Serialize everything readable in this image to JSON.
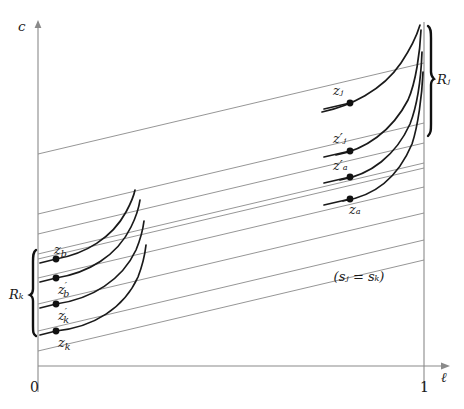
{
  "figure": {
    "name": "indifference-curves-zones-diagram",
    "axes": {
      "y_axis_label": "c",
      "x_axis_label": "ℓ",
      "origin_label": "0",
      "right_tick_label": "1",
      "y_axis_x": 38,
      "x_axis_y": 366,
      "right_vertical_x": 424,
      "y_axis_top": 22
    },
    "annotation": {
      "equality_note": "(sⱼ = sₖ)",
      "x": 360,
      "y": 276
    },
    "brackets": [
      {
        "name": "R_k",
        "label": "Rₖ",
        "x": 36,
        "y_top": 250,
        "y_bottom": 336,
        "label_x": 12,
        "label_y": 295
      },
      {
        "name": "R_j",
        "label": "Rⱼ",
        "x": 428,
        "y_top": 26,
        "y_bottom": 136,
        "label_x": 438,
        "label_y": 80
      }
    ],
    "points": [
      {
        "name": "z_j",
        "label": "zⱼ",
        "x": 350,
        "y": 103,
        "label_x": 334,
        "label_y": 92,
        "label_pos": "above-left"
      },
      {
        "name": "z_j_prime",
        "label": "z′ⱼ",
        "x": 350,
        "y": 151,
        "label_x": 334,
        "label_y": 140,
        "label_pos": "above-left"
      },
      {
        "name": "z_a_prime",
        "label": "z′ₐ",
        "x": 350,
        "y": 177,
        "label_x": 334,
        "label_y": 166,
        "label_pos": "above-left"
      },
      {
        "name": "z_a",
        "label": "zₐ",
        "x": 350,
        "y": 199,
        "label_x": 350,
        "label_y": 212,
        "label_pos": "below-right"
      },
      {
        "name": "z_b",
        "label": "z_b",
        "x": 56,
        "y": 259,
        "label_x": 56,
        "label_y": 250,
        "label_pos": "above-right"
      },
      {
        "name": "z_b_prime",
        "label": "z'_b",
        "x": 56,
        "y": 278,
        "label_x": 60,
        "label_y": 292,
        "label_pos": "below-right"
      },
      {
        "name": "z_k_prime",
        "label": "z'_k",
        "x": 56,
        "y": 304,
        "label_x": 60,
        "label_y": 318,
        "label_pos": "below-right"
      },
      {
        "name": "z_k",
        "label": "z_k",
        "x": 56,
        "y": 331,
        "label_x": 60,
        "label_y": 345,
        "label_pos": "below-right"
      }
    ],
    "budget_lines": {
      "color": "#8a8a8a",
      "count": 9,
      "slope": -0.236,
      "left_x": 38,
      "right_x": 424,
      "left_y": [
        154,
        214,
        234,
        254,
        259,
        278,
        304,
        331,
        351
      ]
    },
    "indifference_curves": {
      "color": "#1a1a1a",
      "left_group": [
        {
          "name": "curve-z_b",
          "x0": 56,
          "y0": 259,
          "x1": 135,
          "y1": 191
        },
        {
          "name": "curve-z_b'",
          "x0": 56,
          "y0": 278,
          "x1": 140,
          "y1": 201
        },
        {
          "name": "curve-z_k'",
          "x0": 56,
          "y0": 304,
          "x1": 143,
          "y1": 222
        },
        {
          "name": "curve-z_k",
          "x0": 56,
          "y0": 331,
          "x1": 145,
          "y1": 245
        }
      ],
      "right_group": [
        {
          "name": "curve-z_j",
          "x0": 350,
          "y0": 103,
          "x1": 424,
          "y1": 26
        },
        {
          "name": "curve-z_j'",
          "x0": 350,
          "y0": 151,
          "x1": 424,
          "y1": 30
        },
        {
          "name": "curve-z_a'",
          "x0": 350,
          "y0": 177,
          "x1": 424,
          "y1": 52
        },
        {
          "name": "curve-z_a",
          "x0": 350,
          "y0": 199,
          "x1": 424,
          "y1": 72
        }
      ]
    }
  }
}
